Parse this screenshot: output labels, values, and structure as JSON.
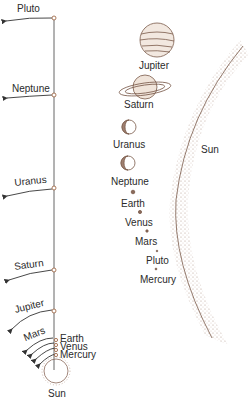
{
  "diagram": {
    "colors": {
      "ink": "#2b2b2b",
      "stipple": "#8a6a5a",
      "axis": "#555555",
      "node": "#b07a5a"
    },
    "distance_panel": {
      "planets": [
        {
          "name": "Pluto",
          "y": 18
        },
        {
          "name": "Neptune",
          "y": 95
        },
        {
          "name": "Uranus",
          "y": 188
        },
        {
          "name": "Saturn",
          "y": 270
        },
        {
          "name": "Jupiter",
          "y": 312
        },
        {
          "name": "Mars",
          "y": 338
        },
        {
          "name": "Earth",
          "y": 343
        },
        {
          "name": "Venus",
          "y": 350
        },
        {
          "name": "Mercury",
          "y": 356
        }
      ],
      "sun_label": "Sun"
    },
    "size_panel": {
      "planets": [
        {
          "name": "Jupiter"
        },
        {
          "name": "Saturn"
        },
        {
          "name": "Uranus"
        },
        {
          "name": "Neptune"
        },
        {
          "name": "Earth"
        },
        {
          "name": "Venus"
        },
        {
          "name": "Mars"
        },
        {
          "name": "Pluto"
        },
        {
          "name": "Mercury"
        }
      ],
      "sun_label": "Sun"
    }
  }
}
